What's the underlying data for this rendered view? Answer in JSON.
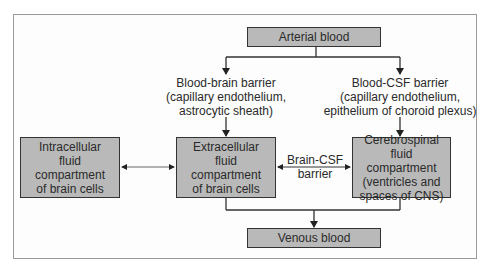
{
  "diagram": {
    "nodes": {
      "arterial": "Arterial blood",
      "intracellular": "Intracellular\nfluid\ncompartment\nof brain cells",
      "extracellular": "Extracellular\nfluid\ncompartment\nof brain cells",
      "csf": "Cerebrospinal fluid\ncompartment\n(ventricles and\nspaces of CNS)",
      "venous": "Venous blood"
    },
    "labels": {
      "bbb": "Blood-brain barrier\n(capillary endothelium,\nastrocytic sheath)",
      "bcsf": "Blood-CSF barrier\n(capillary endothelium,\nepithelium of choroid plexus)",
      "brain_csf": "Brain-CSF\nbarrier"
    },
    "edges": [
      {
        "from": "Arterial blood",
        "to": "Extracellular fluid compartment of brain cells",
        "via": "Blood-brain barrier"
      },
      {
        "from": "Arterial blood",
        "to": "Cerebrospinal fluid compartment",
        "via": "Blood-CSF barrier"
      },
      {
        "from": "Intracellular fluid compartment of brain cells",
        "to": "Extracellular fluid compartment of brain cells",
        "bidirectional": true
      },
      {
        "from": "Extracellular fluid compartment of brain cells",
        "to": "Cerebrospinal fluid compartment",
        "via": "Brain-CSF barrier",
        "bidirectional": true
      },
      {
        "from": "Extracellular fluid compartment of brain cells",
        "to": "Venous blood"
      },
      {
        "from": "Cerebrospinal fluid compartment",
        "to": "Venous blood"
      }
    ],
    "colors": {
      "box_fill": "#b9b9b9",
      "line": "#333333",
      "frame": "#9a9a9a"
    }
  }
}
